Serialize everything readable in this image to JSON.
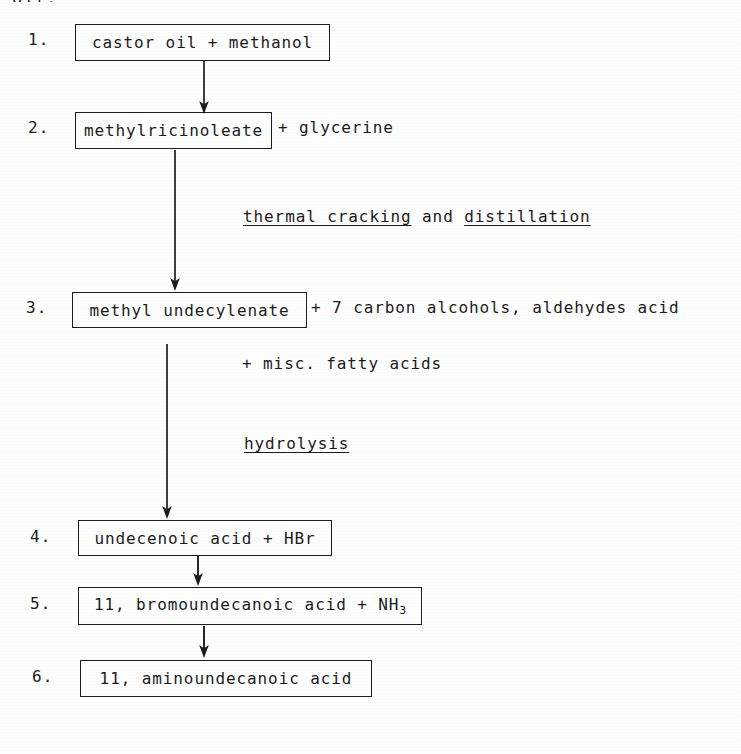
{
  "document": {
    "clipped_header_fragment": "oil.",
    "background_color": "#fefefe",
    "ink_color": "#1b1b1b"
  },
  "steps": [
    {
      "number": "1.",
      "box_text": "castor oil + methanol",
      "trailing_text": "",
      "extra_line": ""
    },
    {
      "number": "2.",
      "box_text": "methylricinoleate",
      "trailing_text": "+ glycerine",
      "extra_line": ""
    },
    {
      "number": "3.",
      "box_text": "methyl undecylenate",
      "trailing_text": "+ 7 carbon alcohols, aldehydes acid",
      "extra_line": "+ misc. fatty acids"
    },
    {
      "number": "4.",
      "box_text": "undecenoic acid + HBr",
      "trailing_text": "",
      "extra_line": ""
    },
    {
      "number": "5.",
      "box_text_prefix": "11, bromoundecanoic acid + NH",
      "box_text_subscript": "3",
      "trailing_text": "",
      "extra_line": ""
    },
    {
      "number": "6.",
      "box_text": "11, aminoundecanoic acid",
      "trailing_text": "",
      "extra_line": ""
    }
  ],
  "annotations": [
    {
      "id": "thermal-cracking",
      "part_underlined_1": "thermal cracking",
      "part_plain": " and ",
      "part_underlined_2": "distillation"
    },
    {
      "id": "hydrolysis",
      "part_underlined_1": "hydrolysis"
    }
  ],
  "arrows": [
    {
      "id": "arrow-step1-step2",
      "label": "arrow from castor oil box to methylricinoleate box"
    },
    {
      "id": "arrow-step2-step3",
      "label": "arrow from methylricinoleate box to methyl undecylenate box"
    },
    {
      "id": "arrow-step3-step4",
      "label": "arrow from methyl undecylenate box to undecenoic acid box"
    },
    {
      "id": "arrow-step4-step5",
      "label": "arrow from undecenoic acid box to bromoundecanoic acid box"
    },
    {
      "id": "arrow-step5-step6",
      "label": "arrow from bromoundecanoic acid box to aminoundecanoic acid box"
    }
  ]
}
